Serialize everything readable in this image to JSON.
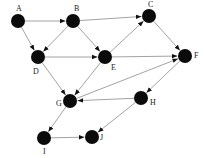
{
  "diagram": {
    "type": "directed-graph",
    "nodes": [
      {
        "id": "A",
        "label": "A",
        "x": 18,
        "y": 21,
        "lx": 16,
        "ly": 11
      },
      {
        "id": "B",
        "label": "B",
        "x": 73,
        "y": 21,
        "lx": 74,
        "ly": 11
      },
      {
        "id": "C",
        "label": "C",
        "x": 149,
        "y": 16,
        "lx": 148,
        "ly": 7
      },
      {
        "id": "D",
        "label": "D",
        "x": 38,
        "y": 57,
        "lx": 33,
        "ly": 74
      },
      {
        "id": "E",
        "label": "E",
        "x": 105,
        "y": 57,
        "lx": 111,
        "ly": 70
      },
      {
        "id": "F",
        "label": "F",
        "x": 185,
        "y": 56,
        "lx": 194,
        "ly": 58
      },
      {
        "id": "G",
        "label": "G",
        "x": 70,
        "y": 101,
        "lx": 56,
        "ly": 106
      },
      {
        "id": "H",
        "label": "H",
        "x": 141,
        "y": 98,
        "lx": 150,
        "ly": 105
      },
      {
        "id": "I",
        "label": "I",
        "x": 44,
        "y": 138,
        "lx": 43,
        "ly": 154
      },
      {
        "id": "J",
        "label": "J",
        "x": 92,
        "y": 137,
        "lx": 100,
        "ly": 140
      }
    ],
    "edges": [
      {
        "from": "A",
        "to": "B"
      },
      {
        "from": "A",
        "to": "D"
      },
      {
        "from": "B",
        "to": "D"
      },
      {
        "from": "B",
        "to": "E"
      },
      {
        "from": "B",
        "to": "C"
      },
      {
        "from": "D",
        "to": "E"
      },
      {
        "from": "D",
        "to": "G"
      },
      {
        "from": "E",
        "to": "C"
      },
      {
        "from": "E",
        "to": "F"
      },
      {
        "from": "E",
        "to": "G"
      },
      {
        "from": "C",
        "to": "F"
      },
      {
        "from": "G",
        "to": "F"
      },
      {
        "from": "F",
        "to": "H"
      },
      {
        "from": "H",
        "to": "G"
      },
      {
        "from": "H",
        "to": "J"
      },
      {
        "from": "G",
        "to": "I"
      },
      {
        "from": "I",
        "to": "J"
      }
    ],
    "colors": {
      "node": "#0b0b0b",
      "edge": "#8a8a8a",
      "label": "#222222"
    },
    "node_radius": 7
  }
}
